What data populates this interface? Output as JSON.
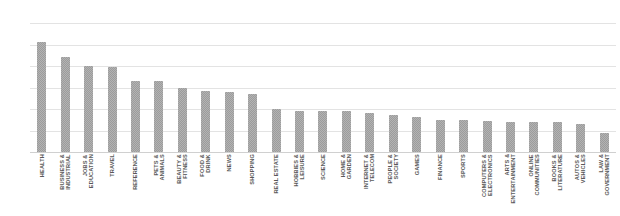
{
  "chart_data": {
    "type": "bar",
    "title": "",
    "subtitle": "",
    "xlabel": "",
    "ylabel": "",
    "ylim": [
      0,
      300
    ],
    "yticks": [
      0,
      50,
      100,
      150,
      200,
      250,
      300
    ],
    "grid": true,
    "legend": false,
    "legend_position": "none",
    "bar_color": "#b3b3b3",
    "gridline_color": "#e3e3e3",
    "label_color": "#595959",
    "tick_color": "#8a8a8a",
    "categories": [
      "HEALTH",
      "BUSINESS &\nINDUSTRIAL",
      "JOBS &\nEDUCATION",
      "TRAVEL",
      "REFERENCE",
      "PETS &\nANIMALS",
      "BEAUTY &\nFITNESS",
      "FOOD &\nDRINK",
      "NEWS",
      "SHOPPING",
      "REAL ESTATE",
      "HOBBIES &\nLEISURE",
      "SCIENCE",
      "HOME &\nGARDEN",
      "INTERNET &\nTELECOM",
      "PEOPLE &\nSOCIETY",
      "GAMES",
      "FINANCE",
      "SPORTS",
      "COMPUTERS &\nELECTRONICS",
      "ARTS &\nENTERTAINMENT",
      "ONLINE\nCOMMUNITIES",
      "BOOKS &\nLITERATURE",
      "AUTOS &\nVEHICLES",
      "LAW &\nGOVERNMENT"
    ],
    "values": [
      255,
      220,
      200,
      197,
      165,
      165,
      150,
      143,
      140,
      135,
      100,
      95,
      95,
      95,
      90,
      85,
      82,
      75,
      75,
      72,
      70,
      70,
      70,
      65,
      45
    ]
  }
}
